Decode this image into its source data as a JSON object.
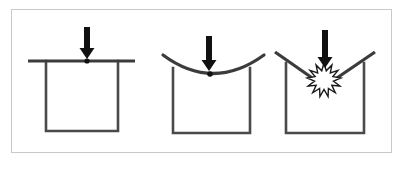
{
  "figure": {
    "type": "diagram",
    "canvas": {
      "width": 405,
      "height": 169
    },
    "background_color": "#ffffff",
    "frame": {
      "name": "figure-border",
      "x": 11,
      "y": 9,
      "width": 381,
      "height": 144,
      "stroke_color": "#c9c9c9",
      "stroke_width": 1,
      "fill": "#ffffff"
    },
    "stroke_colors": {
      "beam": "#3c3c3c",
      "container": "#4a4a4a",
      "arrow": "#111111",
      "burst_outline": "#1a1a1a",
      "burst_fill": "#ffffff",
      "contact_dot": "#111111"
    },
    "stroke_widths": {
      "beam": 3.2,
      "container": 2.6,
      "burst": 1.4
    },
    "panels": [
      {
        "id": "panel-1",
        "name": "stage-undeformed",
        "label": "",
        "stage": "flat",
        "member": {
          "name": "beam-flat",
          "shape": "straight-line",
          "x1": 28,
          "y1": 61,
          "x2": 135,
          "y2": 61
        },
        "container": {
          "name": "container-u-shape",
          "left_x": 46,
          "right_x": 118,
          "top_y": 61,
          "bottom_y": 131
        },
        "arrow": {
          "name": "load-arrow",
          "x": 87,
          "tip_y": 59,
          "tail_y": 27,
          "shaft_width": 6,
          "head_width": 15,
          "head_height": 11
        },
        "contact_dot": {
          "name": "contact-point-dot",
          "cx": 87,
          "cy": 61,
          "r": 2.6
        }
      },
      {
        "id": "panel-2",
        "name": "stage-deflected",
        "label": "",
        "stage": "sagging",
        "member": {
          "name": "beam-deflected",
          "shape": "sagging-curve",
          "x1": 163,
          "y1": 55,
          "x2": 264,
          "y2": 55,
          "control_x": 213,
          "control_y": 92,
          "lowest_x": 213,
          "lowest_y": 73
        },
        "container": {
          "name": "container-u-shape",
          "left_x": 173,
          "right_x": 250,
          "top_y": 68,
          "bottom_y": 133
        },
        "arrow": {
          "name": "load-arrow",
          "x": 209,
          "tip_y": 71,
          "tail_y": 36,
          "shaft_width": 6,
          "head_width": 15,
          "head_height": 11
        },
        "contact_dot": {
          "name": "contact-point-dot",
          "cx": 210,
          "cy": 74,
          "r": 2.8
        }
      },
      {
        "id": "panel-3",
        "name": "stage-fractured",
        "label": "",
        "stage": "broken",
        "member": {
          "name": "beam-fractured",
          "shape": "two-broken-segments",
          "left_segment": {
            "x1": 275,
            "y1": 52,
            "x2": 318,
            "y2": 82
          },
          "right_segment": {
            "x1": 375,
            "y1": 52,
            "x2": 331,
            "y2": 82
          }
        },
        "container": {
          "name": "container-u-shape",
          "left_x": 286,
          "right_x": 364,
          "top_y": 63,
          "bottom_y": 133
        },
        "arrow": {
          "name": "load-arrow",
          "x": 325,
          "tip_y": 68,
          "tail_y": 30,
          "shaft_width": 6,
          "head_width": 15,
          "head_height": 11
        },
        "burst": {
          "name": "fracture-starburst",
          "cx": 324,
          "cy": 80,
          "outer_r": 17,
          "inner_r": 9.5,
          "points": 13
        }
      }
    ]
  }
}
